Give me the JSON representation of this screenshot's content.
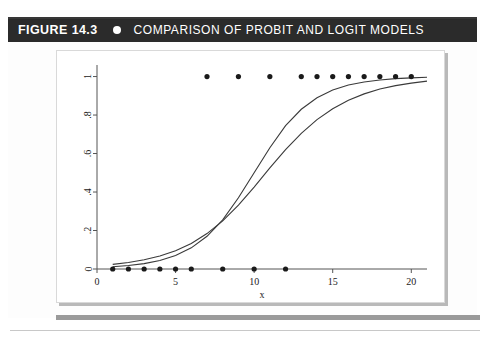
{
  "figure": {
    "label": "FIGURE",
    "number": "14.3",
    "bullet_icon": "circle-bullet-icon",
    "title": "COMPARISON OF PROBIT AND LOGIT MODELS",
    "header_bg": "#2b2b2b",
    "header_fg": "#ffffff"
  },
  "chart_data": {
    "type": "scatter",
    "title": "",
    "xlabel": "x",
    "ylabel": "",
    "xlim": [
      0,
      21
    ],
    "ylim": [
      0,
      1.06
    ],
    "xticks": [
      0,
      5,
      10,
      15,
      20
    ],
    "xticklabels": [
      "0",
      "5",
      "10",
      "15",
      "20"
    ],
    "yticks": [
      0,
      0.2,
      0.4,
      0.6,
      0.8,
      1
    ],
    "yticklabels": [
      "0",
      ".2",
      ".4",
      ".6",
      ".8",
      "1"
    ],
    "ytick_rotation": 90,
    "grid": false,
    "marker_color": "#1a1a1a",
    "line_color": "#3a3a3a",
    "series": [
      {
        "name": "observed",
        "type": "scatter",
        "x": [
          1,
          2,
          3,
          4,
          5,
          6,
          7,
          8,
          9,
          10,
          11,
          12,
          13,
          14,
          15,
          16,
          17,
          18,
          19,
          20
        ],
        "y": [
          0,
          0,
          0,
          0,
          0,
          0,
          1,
          0,
          1,
          0,
          1,
          0,
          1,
          1,
          1,
          1,
          1,
          1,
          1,
          1
        ]
      },
      {
        "name": "probit",
        "type": "line",
        "x": [
          1,
          2,
          3,
          4,
          5,
          6,
          7,
          8,
          9,
          10,
          11,
          12,
          13,
          14,
          15,
          16,
          17,
          18,
          19,
          20,
          21
        ],
        "y": [
          0.012,
          0.018,
          0.028,
          0.044,
          0.07,
          0.11,
          0.17,
          0.255,
          0.37,
          0.5,
          0.63,
          0.745,
          0.83,
          0.89,
          0.93,
          0.956,
          0.972,
          0.982,
          0.989,
          0.993,
          0.996
        ]
      },
      {
        "name": "logit",
        "type": "line",
        "x": [
          1,
          2,
          3,
          4,
          5,
          6,
          7,
          8,
          9,
          10,
          11,
          12,
          13,
          14,
          15,
          16,
          17,
          18,
          19,
          20,
          21
        ],
        "y": [
          0.024,
          0.034,
          0.048,
          0.068,
          0.095,
          0.133,
          0.184,
          0.25,
          0.332,
          0.426,
          0.525,
          0.62,
          0.705,
          0.776,
          0.833,
          0.877,
          0.91,
          0.935,
          0.953,
          0.966,
          0.976
        ]
      }
    ],
    "legend": [],
    "annotations": []
  }
}
